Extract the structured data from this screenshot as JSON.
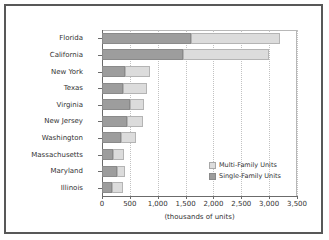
{
  "chart_data": {
    "type": "bar",
    "orientation": "horizontal",
    "stacked": true,
    "title": "",
    "xlabel": "(thousands of units)",
    "ylabel": "",
    "xlim": [
      0,
      3500
    ],
    "xticks": [
      0,
      500,
      1000,
      1500,
      2000,
      2500,
      3000,
      3500
    ],
    "xtick_labels": [
      "0",
      "500",
      "1,000",
      "1,500",
      "2,000",
      "2,500",
      "3,000",
      "3,500"
    ],
    "grid": true,
    "legend_position": "inside-lower-right",
    "categories": [
      "Florida",
      "California",
      "New York",
      "Texas",
      "Virginia",
      "New Jersey",
      "Washington",
      "Massachusetts",
      "Maryland",
      "Illinois"
    ],
    "series": [
      {
        "name": "Single-Family Units",
        "color": "#9d9d9d",
        "values": [
          1600,
          1455,
          415,
          375,
          500,
          450,
          340,
          200,
          270,
          180
        ]
      },
      {
        "name": "Multi-Family Units",
        "color": "#dcdcdc",
        "values": [
          1595,
          1545,
          445,
          430,
          255,
          285,
          270,
          195,
          140,
          200
        ]
      }
    ],
    "totals": [
      3195,
      3000,
      860,
      805,
      755,
      735,
      610,
      395,
      410,
      380
    ]
  },
  "legend": {
    "entries": [
      {
        "label": "Multi-Family Units",
        "swatch": "#dcdcdc"
      },
      {
        "label": "Single-Family Units",
        "swatch": "#9d9d9d"
      }
    ]
  }
}
